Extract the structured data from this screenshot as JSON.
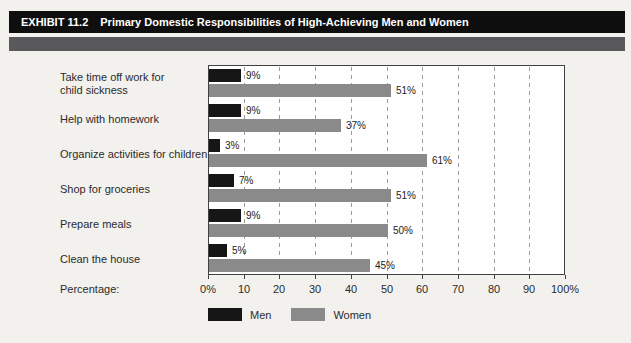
{
  "header": {
    "exhibit_label": "EXHIBIT 11.2",
    "title": "Primary Domestic Responsibilities of High-Achieving Men and Women"
  },
  "colors": {
    "header_bar": "#0e0e0e",
    "divider_bar": "#59585a",
    "men": "#161616",
    "women": "#8a8a8a",
    "plot_border": "#414141",
    "gridline": "#9b9b9b",
    "background": "#f2f1ee"
  },
  "chart_data": {
    "type": "bar",
    "orientation": "horizontal",
    "title": "Primary Domestic Responsibilities of High-Achieving Men and Women",
    "categories": [
      "Take time off work for\nchild sickness",
      "Help with homework",
      "Organize activities for children",
      "Shop for groceries",
      "Prepare meals",
      "Clean the house"
    ],
    "series": [
      {
        "name": "Men",
        "color": "#161616",
        "values": [
          9,
          9,
          3,
          7,
          9,
          5
        ]
      },
      {
        "name": "Women",
        "color": "#8a8a8a",
        "values": [
          51,
          37,
          61,
          51,
          50,
          45
        ]
      }
    ],
    "value_suffix": "%",
    "xlabel": "Percentage:",
    "xlim": [
      0,
      100
    ],
    "xticks": [
      "0%",
      "10",
      "20",
      "30",
      "40",
      "50",
      "60",
      "70",
      "80",
      "90",
      "100%"
    ],
    "grid": "dashed-vertical-every-10",
    "legend": {
      "position": "bottom",
      "entries": [
        {
          "label": "Men",
          "color": "#161616"
        },
        {
          "label": "Women",
          "color": "#8a8a8a"
        }
      ]
    }
  }
}
